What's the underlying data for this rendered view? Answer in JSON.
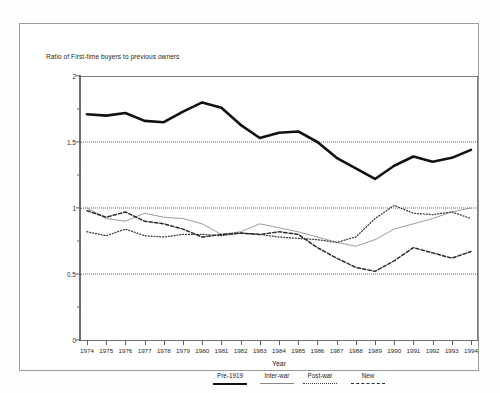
{
  "chart": {
    "title": "Ratio of First-time buyers to previous owners",
    "x_axis_title": "Year"
  },
  "legend": {
    "items": [
      {
        "label": "Pre-1919",
        "style": "thick-solid",
        "color": "#111111"
      },
      {
        "label": "Inter-war",
        "style": "thin-solid",
        "color": "#8a8a8a"
      },
      {
        "label": "Post-war",
        "style": "dotted",
        "color": "#3a3a3a"
      },
      {
        "label": "New",
        "style": "dashed",
        "color": "#2b2b2b"
      }
    ]
  },
  "chart_data": {
    "type": "line",
    "title": "Ratio of First-time buyers to previous owners",
    "xlabel": "Year",
    "ylabel": "",
    "ylim": [
      0,
      2
    ],
    "y_ticks": [
      0,
      0.5,
      1,
      1.5,
      2
    ],
    "y_tick_labels": [
      "0",
      "0.5",
      "1",
      "1.5",
      "2"
    ],
    "y_minor_ticks": [
      0.25,
      0.75,
      1.25,
      1.75
    ],
    "gridlines": [
      0.5,
      1,
      1.5
    ],
    "grid": true,
    "legend_position": "below",
    "x": [
      1974,
      1975,
      1976,
      1977,
      1978,
      1979,
      1980,
      1981,
      1982,
      1983,
      1984,
      1985,
      1986,
      1987,
      1988,
      1989,
      1990,
      1991,
      1992,
      1993,
      1994
    ],
    "categories": [
      "1974",
      "1975",
      "1976",
      "1977",
      "1978",
      "1979",
      "1980",
      "1981",
      "1982",
      "1983",
      "1984",
      "1985",
      "1986",
      "1987",
      "1988",
      "1989",
      "1990",
      "1991",
      "1992",
      "1993",
      "1994"
    ],
    "series": [
      {
        "name": "Pre-1919",
        "style": "thick-solid",
        "color": "#111111",
        "values": [
          1.71,
          1.7,
          1.72,
          1.66,
          1.65,
          1.73,
          1.8,
          1.76,
          1.63,
          1.53,
          1.57,
          1.58,
          1.5,
          1.38,
          1.3,
          1.22,
          1.32,
          1.39,
          1.35,
          1.38,
          1.44
        ]
      },
      {
        "name": "Inter-war",
        "style": "thin-solid",
        "color": "#8a8a8a",
        "values": [
          1.0,
          0.92,
          0.9,
          0.96,
          0.93,
          0.92,
          0.88,
          0.8,
          0.82,
          0.88,
          0.85,
          0.82,
          0.78,
          0.74,
          0.71,
          0.76,
          0.84,
          0.88,
          0.92,
          0.97,
          1.0
        ]
      },
      {
        "name": "Post-war",
        "style": "dotted",
        "color": "#3a3a3a",
        "values": [
          0.82,
          0.79,
          0.84,
          0.79,
          0.78,
          0.8,
          0.8,
          0.79,
          0.81,
          0.8,
          0.78,
          0.77,
          0.76,
          0.74,
          0.78,
          0.92,
          1.02,
          0.96,
          0.95,
          0.97,
          0.92
        ]
      },
      {
        "name": "New",
        "style": "dashed",
        "color": "#2b2b2b",
        "values": [
          0.98,
          0.93,
          0.97,
          0.9,
          0.88,
          0.84,
          0.78,
          0.8,
          0.81,
          0.8,
          0.82,
          0.8,
          0.7,
          0.62,
          0.55,
          0.52,
          0.6,
          0.7,
          0.66,
          0.62,
          0.67
        ]
      }
    ]
  }
}
